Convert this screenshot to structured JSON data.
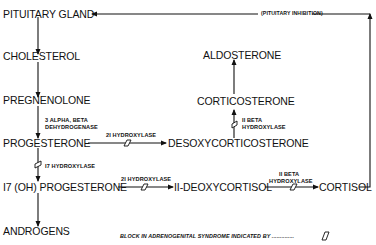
{
  "nodes": {
    "pituitary": "PITUITARY GLAND",
    "cholesterol": "CHOLESTEROL",
    "pregnenolone": "PREGNENOLONE",
    "progesterone": "PROGESTERONE",
    "hydroxyprogesterone": "I7 (OH) PROGESTERONE",
    "androgens": "ANDROGENS",
    "desoxycorticosterone": "DESOXYCORTICOSTERONE",
    "corticosterone": "CORTICOSTERONE",
    "aldosterone": "ALDOSTERONE",
    "deoxycortisol": "II-DEOXYCORTISOL",
    "cortisol": "CORTISOL"
  },
  "enzymes": {
    "dehydrogenase_line1": "3 ALPHA, BETA",
    "dehydrogenase_line2": "DEHYDROGENASE",
    "hydroxylase21_a": "2I HYDROXYLASE",
    "hydroxylase17": "I7 HYDROXYLASE",
    "hydroxylase21_b": "2I HYDROXYLASE",
    "beta11_a_line1": "II BETA",
    "beta11_a_line2": "HYDROXYLASE",
    "beta11_b_line1": "II BETA",
    "beta11_b_line2": "HYDROXYLASE"
  },
  "feedback_label": "(PITUITARY INHIBITION)",
  "legend": "BLOCK IN ADRENOGENITAL SYNDROME INDICATED BY ..............",
  "colors": {
    "ink": "#111111",
    "background": "#ffffff"
  }
}
